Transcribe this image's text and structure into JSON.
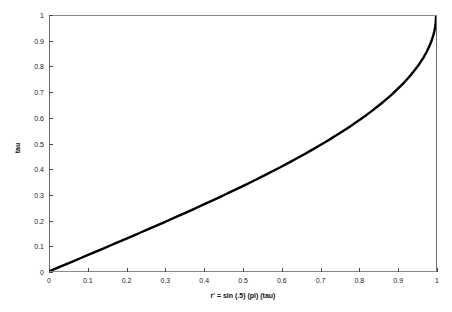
{
  "chart_data": {
    "type": "line",
    "title": "",
    "xlabel": "r' = sin (.5) (pi) (tau)",
    "ylabel": "tau",
    "xlim": [
      0,
      1
    ],
    "ylim": [
      0,
      1
    ],
    "grid": false,
    "legend": null,
    "xticks": [
      "0",
      "0.1",
      "0.2",
      "0.3",
      "0.4",
      "0.5",
      "0.6",
      "0.7",
      "0.8",
      "0.9",
      "1"
    ],
    "xtick_values": [
      0,
      0.1,
      0.2,
      0.3,
      0.4,
      0.5,
      0.6,
      0.7,
      0.8,
      0.9,
      1
    ],
    "yticks": [
      "0",
      "0.1",
      "0.2",
      "0.3",
      "0.4",
      "0.5",
      "0.6",
      "0.7",
      "0.8",
      "0.9",
      "1"
    ],
    "ytick_values": [
      0,
      0.1,
      0.2,
      0.3,
      0.4,
      0.5,
      0.6,
      0.7,
      0.8,
      0.9,
      1
    ],
    "series": [
      {
        "name": "tau vs r'",
        "color": "#000000",
        "linewidth": 2.4,
        "x": [
          0,
          0.0157,
          0.0314,
          0.0471,
          0.0628,
          0.0785,
          0.0941,
          0.1097,
          0.1253,
          0.1409,
          0.1564,
          0.1719,
          0.1874,
          0.2028,
          0.2181,
          0.2334,
          0.2487,
          0.2639,
          0.279,
          0.294,
          0.309,
          0.3239,
          0.3387,
          0.3535,
          0.3681,
          0.3827,
          0.3971,
          0.4115,
          0.4258,
          0.4399,
          0.454,
          0.4679,
          0.4818,
          0.4955,
          0.509,
          0.5225,
          0.5358,
          0.549,
          0.5621,
          0.575,
          0.5878,
          0.6004,
          0.6129,
          0.6252,
          0.6374,
          0.6494,
          0.6613,
          0.673,
          0.6845,
          0.6959,
          0.7071,
          0.7181,
          0.729,
          0.7396,
          0.7501,
          0.7604,
          0.7705,
          0.7804,
          0.7902,
          0.7997,
          0.809,
          0.8181,
          0.8271,
          0.8358,
          0.8443,
          0.8526,
          0.8607,
          0.8686,
          0.8763,
          0.8838,
          0.891,
          0.898,
          0.9048,
          0.9114,
          0.9178,
          0.9239,
          0.9298,
          0.9354,
          0.9409,
          0.9461,
          0.9511,
          0.9558,
          0.9603,
          0.9646,
          0.9686,
          0.9724,
          0.9759,
          0.9792,
          0.9823,
          0.9851,
          0.9877,
          0.99,
          0.9921,
          0.994,
          0.9956,
          0.9969,
          0.998,
          0.9989,
          0.9995,
          0.9999,
          1
        ],
        "y": [
          0,
          0.01,
          0.02,
          0.03,
          0.04,
          0.05,
          0.06,
          0.07,
          0.08,
          0.09,
          0.1,
          0.11,
          0.12,
          0.13,
          0.14,
          0.15,
          0.16,
          0.17,
          0.18,
          0.19,
          0.2,
          0.21,
          0.22,
          0.23,
          0.24,
          0.25,
          0.26,
          0.27,
          0.28,
          0.29,
          0.3,
          0.31,
          0.32,
          0.33,
          0.34,
          0.35,
          0.36,
          0.37,
          0.38,
          0.39,
          0.4,
          0.41,
          0.42,
          0.43,
          0.44,
          0.45,
          0.46,
          0.47,
          0.48,
          0.49,
          0.5,
          0.51,
          0.52,
          0.53,
          0.54,
          0.55,
          0.56,
          0.57,
          0.58,
          0.59,
          0.6,
          0.61,
          0.62,
          0.63,
          0.64,
          0.65,
          0.66,
          0.67,
          0.68,
          0.69,
          0.7,
          0.71,
          0.72,
          0.73,
          0.74,
          0.75,
          0.76,
          0.77,
          0.78,
          0.79,
          0.8,
          0.81,
          0.82,
          0.83,
          0.84,
          0.85,
          0.86,
          0.87,
          0.88,
          0.89,
          0.9,
          0.91,
          0.92,
          0.93,
          0.94,
          0.95,
          0.96,
          0.97,
          0.98,
          0.99,
          1.0
        ]
      }
    ]
  }
}
